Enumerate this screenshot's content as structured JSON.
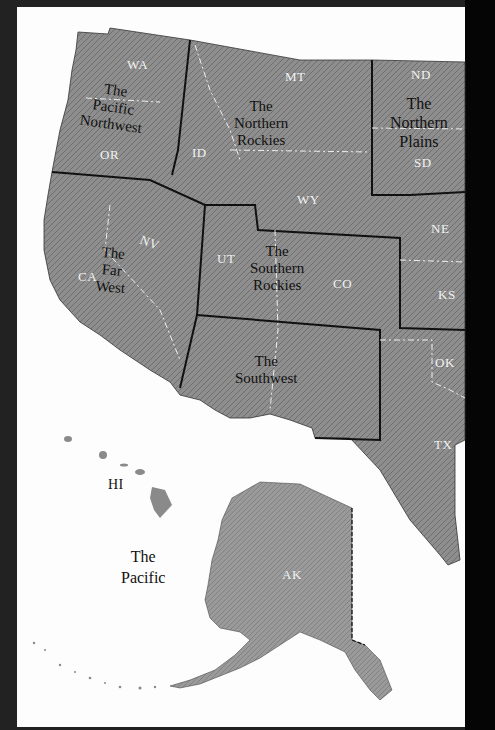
{
  "map": {
    "title": "Western United States regions",
    "colors": {
      "land": "#8c8c8c",
      "land_dark": "#6f6f6f",
      "ocean": "#fdfdfd",
      "frame": "#1a1a1a",
      "region_border": "#111111",
      "state_border": "#f2f2f2"
    },
    "regions": [
      {
        "id": "pacific-northwest",
        "line1": "The",
        "line2": "Pacific",
        "line3": "Northwest"
      },
      {
        "id": "northern-rockies",
        "line1": "The",
        "line2": "Northern",
        "line3": "Rockies"
      },
      {
        "id": "northern-plains",
        "line1": "The",
        "line2": "Northern",
        "line3": "Plains"
      },
      {
        "id": "far-west",
        "line1": "The",
        "line2": "Far",
        "line3": "West"
      },
      {
        "id": "southern-rockies",
        "line1": "The",
        "line2": "Southern",
        "line3": "Rockies"
      },
      {
        "id": "southwest",
        "line1": "The",
        "line2": "Southwest"
      },
      {
        "id": "pacific",
        "line1": "The",
        "line2": "Pacific"
      }
    ],
    "states": {
      "WA": "WA",
      "OR": "OR",
      "ID": "ID",
      "MT": "MT",
      "WY": "WY",
      "ND": "ND",
      "SD": "SD",
      "NE": "NE",
      "KS": "KS",
      "CA": "CA",
      "NV": "NV",
      "UT": "UT",
      "CO": "CO",
      "OK": "OK",
      "TX": "TX",
      "HI": "HI",
      "AK": "AK"
    }
  }
}
